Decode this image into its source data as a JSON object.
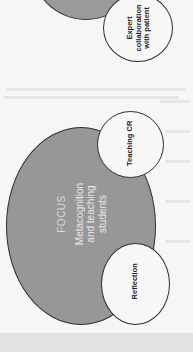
{
  "diagram": {
    "orientation": "rotated 90° counter-clockwise (page scan)",
    "center": {
      "title": "FOCUS",
      "lines": [
        "Metacognition",
        "and teaching",
        "students"
      ],
      "fill": "#979797"
    },
    "satellites": [
      {
        "id": "expert",
        "lines": [
          "Expert",
          "collaboration",
          "with patient"
        ]
      },
      {
        "id": "teaching",
        "lines": [
          "Teaching CR"
        ]
      },
      {
        "id": "reflection",
        "lines": [
          "Reflection"
        ]
      }
    ],
    "colors": {
      "background": "#f6f6f6",
      "circle_outline": "#2e2e2e",
      "satellite_fill": "#f7f7f7",
      "bottom_band": "#e3e3e3"
    }
  }
}
